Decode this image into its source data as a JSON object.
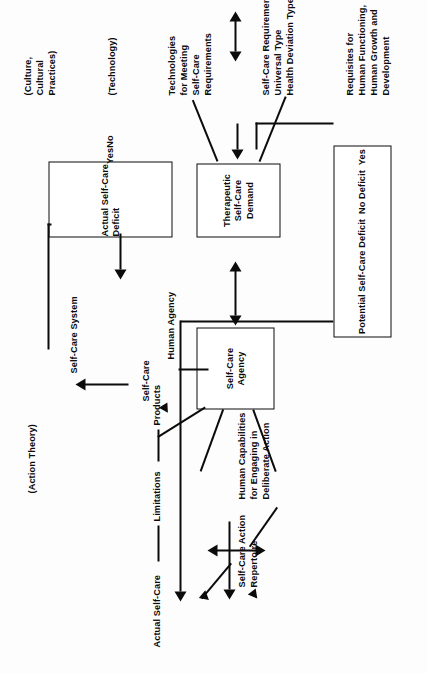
{
  "diagram": {
    "orientation": "rotated-90-ccw",
    "ink_color": "#0b0b0b",
    "background": "#ffffff"
  },
  "boxes": [
    {
      "id": "self-care-agency",
      "lines": [
        "Self-Care",
        "Agency"
      ]
    },
    {
      "id": "actual-self-care-deficit",
      "lines": [
        "Actual Self-Care",
        "Deficit",
        "Yes",
        "No"
      ],
      "title_1": "Actual Self-Care",
      "title_2": "Deficit",
      "option_yes": "Yes",
      "option_no": "No"
    },
    {
      "id": "therapeutic-self-care-demand",
      "lines": [
        "Therapeutic",
        "Self-Care",
        "Demand"
      ]
    },
    {
      "id": "potential-self-care-deficit",
      "lines": [
        "Potential Self-Care Deficit",
        "No Deficit",
        "Yes"
      ],
      "title": "Potential Self-Care Deficit",
      "option_no_deficit": "No Deficit",
      "option_yes": "Yes"
    }
  ],
  "labels": {
    "action_theory": "(Action Theory)",
    "culture_cultural_practices": [
      "(Culture,",
      "Cultural",
      "Practices)"
    ],
    "technology": "(Technology)",
    "actual_self_care": "Actual Self-Care",
    "limitations": "Limitations",
    "products": "Products",
    "self_care_action_repertoire": [
      "Self-Care Action",
      "Repertoire"
    ],
    "human_capabilities": [
      "Human Capabilities",
      "for Engaging in",
      "Deliberate Action"
    ],
    "human_agency": "Human Agency",
    "self_care_system": "Self-Care System",
    "self_care": "Self-Care",
    "technologies_for_meeting": [
      "Technologies",
      "for Meeting",
      "Self-Care",
      "Requirements"
    ],
    "self_care_requirements": [
      "Self-Care Requirements",
      "Universal Type",
      "Health Deviation Type"
    ],
    "requisites": [
      "Requisites for",
      "Human Functioning,",
      "Human Growth and",
      "Development"
    ]
  }
}
